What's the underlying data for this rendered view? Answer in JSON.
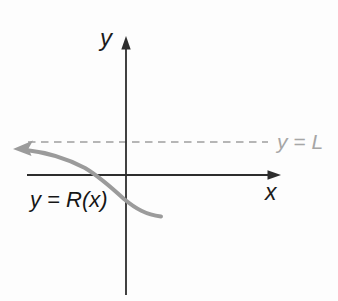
{
  "figure": {
    "type": "function-graph-sketch",
    "labels": {
      "y_axis": "y",
      "x_axis": "x",
      "asymptote": "y = L",
      "curve": "y = R(x)"
    },
    "colors": {
      "background": "#fdfdfd",
      "axis": "#2d2d2d",
      "axis_label": "#1c1c1c",
      "curve": "#9b9b9b",
      "asymptote_line": "#b6b6b6",
      "asymptote_label": "#a6a6a6",
      "curve_label": "#161616"
    },
    "geometry": {
      "y_axis": {
        "x": 126,
        "y1": 46,
        "y2": 295
      },
      "x_axis": {
        "y": 175,
        "x1": 27,
        "x2": 270
      },
      "asymptote": {
        "y": 142,
        "x1": 28,
        "x2": 268,
        "dash": "7.5 5.5"
      },
      "curve_path": "M 26 150 C 48 152.5 66 158 85 168 C 100 177 112 188 124 199 C 136 209 146 214.5 161 216.5",
      "curve_arrowhead_points": "13,149 33,140.5 28.5,148.5 31.5,156",
      "x_axis_arrowhead_points": "281,175 267.5,170.3 267.5,179.7",
      "y_axis_arrowhead_points": "126,36 121.3,49.5 130.7,49.5"
    }
  }
}
